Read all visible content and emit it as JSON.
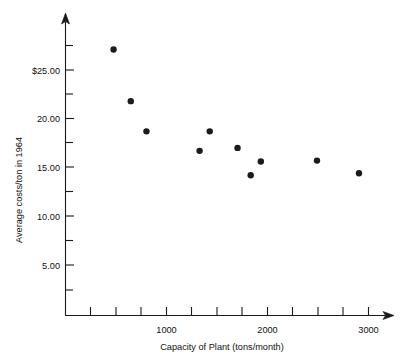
{
  "chart_data": {
    "type": "scatter",
    "title": "",
    "xlabel": "Capacity of Plant (tons/month)",
    "ylabel": "Average costs/ton in 1964",
    "xlim": [
      0,
      3150
    ],
    "ylim": [
      0,
      28.5
    ],
    "grid": false,
    "legend": null,
    "x_tick_labels": [
      "1000",
      "2000",
      "3000"
    ],
    "x_tick_values": [
      1000,
      2000,
      3000
    ],
    "x_minor_tick_values": [
      250,
      500,
      750,
      1250,
      1500,
      1750,
      2250,
      2500,
      2750
    ],
    "y_tick_labels": [
      "$25.00",
      "20.00",
      "15.00",
      "10.00",
      "5.00"
    ],
    "y_tick_values": [
      25,
      20,
      15,
      10,
      5
    ],
    "y_minor_tick_values": [
      27.5,
      22.5,
      17.5,
      12.5,
      7.5,
      2.5
    ],
    "x": [
      475,
      645,
      800,
      1325,
      1425,
      1700,
      1830,
      1930,
      2485,
      2900
    ],
    "y": [
      27.1,
      21.8,
      18.7,
      16.7,
      18.7,
      17.0,
      14.2,
      15.6,
      15.7,
      14.4
    ],
    "points": [
      {
        "x": 475,
        "y": 27.1
      },
      {
        "x": 645,
        "y": 21.8
      },
      {
        "x": 800,
        "y": 18.7
      },
      {
        "x": 1325,
        "y": 16.7
      },
      {
        "x": 1425,
        "y": 18.7
      },
      {
        "x": 1700,
        "y": 17.0
      },
      {
        "x": 1830,
        "y": 14.2
      },
      {
        "x": 1930,
        "y": 15.6
      },
      {
        "x": 2485,
        "y": 15.7
      },
      {
        "x": 2900,
        "y": 14.4
      }
    ],
    "marker": {
      "shape": "circle",
      "color": "#1b1b1b",
      "radius_px": 3.2
    },
    "axis_color": "#1a1a1a",
    "background_color": "#ffffff"
  }
}
